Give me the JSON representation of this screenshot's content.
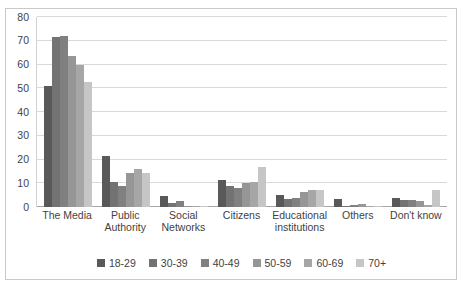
{
  "chart_data": {
    "type": "bar",
    "title": "",
    "xlabel": "",
    "ylabel": "",
    "ylim": [
      0,
      80
    ],
    "yticks": [
      0,
      10,
      20,
      30,
      40,
      50,
      60,
      70,
      80
    ],
    "grid": true,
    "legend_position": "bottom",
    "categories": [
      "The Media",
      "Public Authority",
      "Social Networks",
      "Citizens",
      "Educational institutions",
      "Others",
      "Don't know"
    ],
    "series": [
      {
        "name": "18-29",
        "color": "#595959",
        "values": [
          51,
          21.5,
          4.5,
          11.5,
          5,
          3.5,
          4
        ]
      },
      {
        "name": "30-39",
        "color": "#737373",
        "values": [
          71.5,
          10.5,
          1.5,
          9,
          3.5,
          0.4,
          3
        ]
      },
      {
        "name": "40-49",
        "color": "#808080",
        "values": [
          72,
          9,
          2.5,
          8,
          4,
          0.8,
          3
        ]
      },
      {
        "name": "50-59",
        "color": "#969696",
        "values": [
          63.5,
          14.5,
          0.5,
          10,
          6.5,
          1.2,
          2.5
        ]
      },
      {
        "name": "60-69",
        "color": "#a6a6a6",
        "values": [
          60,
          16,
          0.5,
          10.5,
          7,
          0.5,
          1
        ]
      },
      {
        "name": "70+",
        "color": "#c6c6c6",
        "values": [
          52.5,
          14.5,
          0.5,
          17,
          7,
          0.4,
          7
        ]
      }
    ]
  },
  "colors": {
    "gridline": "#d9d9d9",
    "axis": "#a6a6a6",
    "frame": "#c9c9c9",
    "text": "#3f3f3f",
    "background": "#ffffff"
  }
}
